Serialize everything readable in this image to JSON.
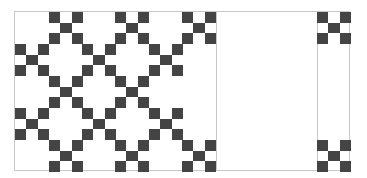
{
  "quilt": {
    "description": "Nine-patch checkerboard quilt pattern",
    "colors": {
      "dark": "#444444",
      "light": "#ffffff",
      "grid_line": "#c8c8c8"
    },
    "cell_width": 33.4,
    "cell_height": 32,
    "columns_x": [
      0,
      34,
      67,
      100,
      134,
      167,
      302
    ],
    "rows_y": [
      0,
      32,
      64,
      96,
      128
    ],
    "blocks": [
      {
        "row": 0,
        "col": 1
      },
      {
        "row": 0,
        "col": 3
      },
      {
        "row": 0,
        "col": 5
      },
      {
        "row": 0,
        "col": 6
      },
      {
        "row": 1,
        "col": 0
      },
      {
        "row": 1,
        "col": 2
      },
      {
        "row": 1,
        "col": 4
      },
      {
        "row": 2,
        "col": 1
      },
      {
        "row": 2,
        "col": 3
      },
      {
        "row": 3,
        "col": 0
      },
      {
        "row": 3,
        "col": 2
      },
      {
        "row": 3,
        "col": 4
      },
      {
        "row": 4,
        "col": 1
      },
      {
        "row": 4,
        "col": 3
      },
      {
        "row": 4,
        "col": 5
      },
      {
        "row": 4,
        "col": 6
      }
    ],
    "nine_patch": [
      1,
      0,
      1,
      0,
      1,
      0,
      1,
      0,
      1
    ],
    "vertical_lines_x": [
      201,
      302
    ]
  }
}
